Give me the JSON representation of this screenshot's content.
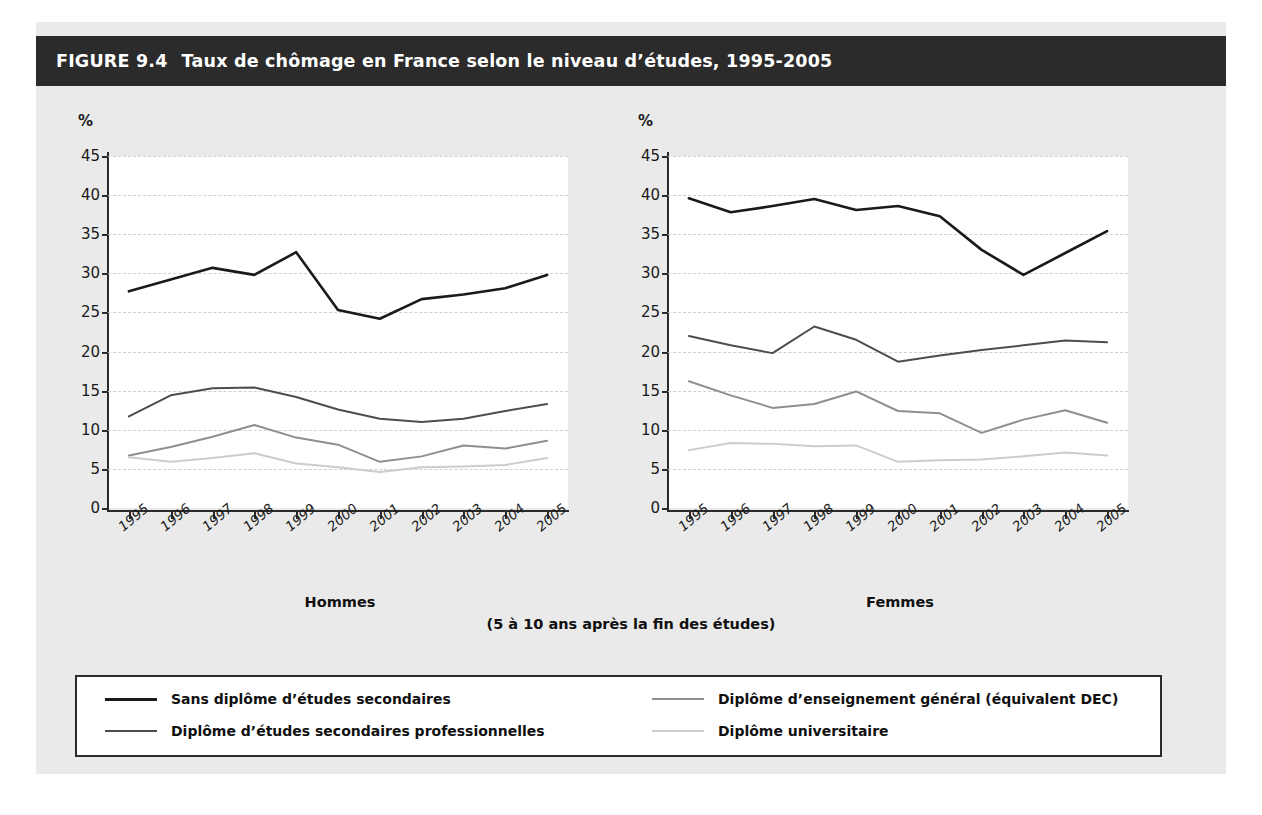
{
  "figure": {
    "number": "FIGURE 9.4",
    "title": "Taux de chômage en France selon le niveau d’études, 1995-2005",
    "subnote": "(5 à 10 ans après la fin des études)",
    "header_bg": "#2b2b2b",
    "panel_bg": "#eaeaea",
    "plot_bg": "#ffffff"
  },
  "chart_data": [
    {
      "type": "line",
      "title": "Hommes",
      "xlabel": "",
      "ylabel": "%",
      "categories": [
        "1995",
        "1996",
        "1997",
        "1998",
        "1999",
        "2000",
        "2001",
        "2002",
        "2003",
        "2004",
        "2005"
      ],
      "ylim": [
        0,
        45
      ],
      "yticks": [
        0,
        5,
        10,
        15,
        20,
        25,
        30,
        35,
        40,
        45
      ],
      "grid": true,
      "legend_position": "bottom",
      "series": [
        {
          "name": "Sans diplôme d’études secondaires",
          "color": "#1a1a1a",
          "values": [
            27.7,
            29.2,
            30.7,
            29.8,
            32.7,
            25.3,
            24.2,
            26.7,
            27.3,
            28.1,
            29.8
          ]
        },
        {
          "name": "Diplôme d’études secondaires professionnelles",
          "color": "#4d4d4d",
          "values": [
            11.7,
            14.4,
            15.3,
            15.4,
            14.2,
            12.6,
            11.4,
            11.0,
            11.4,
            12.4,
            13.3
          ]
        },
        {
          "name": "Diplôme d’enseignement général (équivalent DEC)",
          "color": "#8f8f8f",
          "values": [
            6.7,
            7.8,
            9.1,
            10.6,
            9.0,
            8.1,
            5.9,
            6.6,
            8.0,
            7.6,
            8.6
          ]
        },
        {
          "name": "Diplôme universitaire",
          "color": "#cccccc",
          "values": [
            6.5,
            5.9,
            6.4,
            7.0,
            5.7,
            5.2,
            4.6,
            5.2,
            5.3,
            5.5,
            6.4
          ]
        }
      ]
    },
    {
      "type": "line",
      "title": "Femmes",
      "xlabel": "",
      "ylabel": "%",
      "categories": [
        "1995",
        "1996",
        "1997",
        "1998",
        "1999",
        "2000",
        "2001",
        "2002",
        "2003",
        "2004",
        "2005"
      ],
      "ylim": [
        0,
        45
      ],
      "yticks": [
        0,
        5,
        10,
        15,
        20,
        25,
        30,
        35,
        40,
        45
      ],
      "grid": true,
      "legend_position": "bottom",
      "series": [
        {
          "name": "Sans diplôme d’études secondaires",
          "color": "#1a1a1a",
          "values": [
            39.6,
            37.8,
            38.6,
            39.5,
            38.1,
            38.6,
            37.3,
            33.0,
            29.8,
            32.6,
            35.4
          ]
        },
        {
          "name": "Diplôme d’études secondaires professionnelles",
          "color": "#4d4d4d",
          "values": [
            22.0,
            20.8,
            19.8,
            23.2,
            21.5,
            18.7,
            19.5,
            20.2,
            20.8,
            21.4,
            21.2
          ]
        },
        {
          "name": "Diplôme d’enseignement général (équivalent DEC)",
          "color": "#8f8f8f",
          "values": [
            16.2,
            14.4,
            12.8,
            13.3,
            14.9,
            12.4,
            12.1,
            9.6,
            11.3,
            12.5,
            10.9
          ]
        },
        {
          "name": "Diplôme universitaire",
          "color": "#cccccc",
          "values": [
            7.4,
            8.3,
            8.2,
            7.9,
            8.0,
            5.9,
            6.1,
            6.2,
            6.6,
            7.1,
            6.7
          ]
        }
      ]
    }
  ],
  "legend": {
    "items": [
      {
        "label": "Sans diplôme d’études secondaires",
        "color": "#1a1a1a"
      },
      {
        "label": "Diplôme d’études secondaires professionnelles",
        "color": "#4d4d4d"
      },
      {
        "label": "Diplôme d’enseignement général (équivalent DEC)",
        "color": "#8f8f8f"
      },
      {
        "label": "Diplôme universitaire",
        "color": "#cccccc"
      }
    ]
  }
}
